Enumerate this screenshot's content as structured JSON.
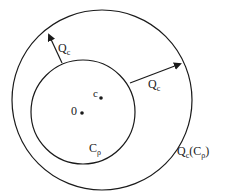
{
  "diagram": {
    "stroke_color": "#1a1a1a",
    "background": "#ffffff",
    "outer_circle": {
      "label_main": "Q",
      "label_sub": "c",
      "label_paren_main": "C",
      "label_paren_sub": "ρ"
    },
    "inner_circle": {
      "label_main": "C",
      "label_sub": "ρ"
    },
    "points": [
      {
        "name": "origin",
        "label": "0"
      },
      {
        "name": "center-c",
        "label": "c"
      }
    ],
    "arrows": [
      {
        "name": "arrow-upper-left",
        "label_main": "Q",
        "label_sub": "c"
      },
      {
        "name": "arrow-right",
        "label_main": "Q",
        "label_sub": "c"
      }
    ]
  }
}
